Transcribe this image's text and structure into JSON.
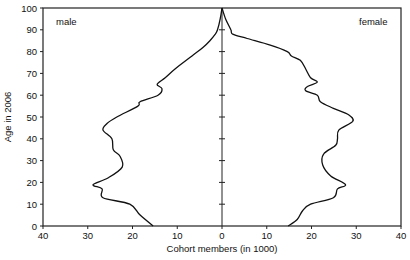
{
  "chart_data": {
    "type": "line",
    "subtype": "population-pyramid",
    "title": "",
    "xlabel": "Cohort members (in 1000)",
    "ylabel": "Age in 2006",
    "xlim": [
      -40,
      40
    ],
    "ylim": [
      0,
      100
    ],
    "x_ticks": [
      40,
      30,
      20,
      10,
      0,
      10,
      20,
      30,
      40
    ],
    "y_ticks": [
      0,
      10,
      20,
      30,
      40,
      50,
      60,
      70,
      80,
      90,
      100
    ],
    "grid": false,
    "legend": "inline labels (male top-left, female top-right)",
    "annotations": [
      "male",
      "female"
    ],
    "series": [
      {
        "name": "male",
        "side": "left",
        "ages": [
          0,
          5,
          10,
          13,
          17,
          19,
          22,
          27,
          32,
          35,
          40,
          44,
          47,
          50,
          55,
          57,
          60,
          63,
          65,
          68,
          72,
          78,
          82,
          85,
          88,
          90,
          95,
          100
        ],
        "values": [
          15.4,
          18.3,
          20.6,
          26.6,
          26.8,
          28.8,
          25.5,
          22.3,
          22.8,
          24.3,
          24.6,
          26.6,
          25.7,
          23.5,
          18.8,
          18.3,
          14.3,
          13.4,
          14.5,
          12.7,
          10.5,
          6.7,
          4.2,
          2.7,
          1.5,
          1.0,
          0.4,
          0.0
        ]
      },
      {
        "name": "female",
        "side": "right",
        "ages": [
          0,
          3,
          7,
          10,
          13,
          17,
          19,
          23,
          28,
          33,
          37,
          40,
          44,
          48,
          51,
          54,
          57,
          60,
          62,
          64,
          66,
          68,
          72,
          76,
          78,
          80,
          83,
          86,
          88,
          90,
          95,
          100
        ],
        "values": [
          14.8,
          16.8,
          18.0,
          19.8,
          24.9,
          25.8,
          27.6,
          24.3,
          22.5,
          22.7,
          25.4,
          25.8,
          26.1,
          29.2,
          28.3,
          24.9,
          22.0,
          21.3,
          18.7,
          19.1,
          21.3,
          19.8,
          18.7,
          17.5,
          15.5,
          14.6,
          10.8,
          5.6,
          2.4,
          2.0,
          0.8,
          0.0
        ]
      }
    ]
  },
  "labels": {
    "male": "male",
    "female": "female",
    "xlabel": "Cohort members (in 1000)",
    "ylabel": "Age in 2006"
  },
  "colors": {
    "line": "#111111",
    "axis": "#222222",
    "background": "#ffffff"
  }
}
